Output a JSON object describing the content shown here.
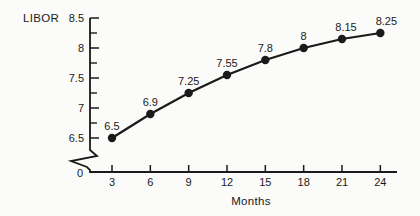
{
  "figure": {
    "background": "#fbfbf9",
    "ink": "#1a1a1a"
  },
  "chart_data": {
    "type": "line",
    "title": "",
    "xlabel": "Months",
    "ylabel": "LIBOR",
    "x": [
      3,
      6,
      9,
      12,
      15,
      18,
      21,
      24
    ],
    "values": [
      6.5,
      6.9,
      7.25,
      7.55,
      7.8,
      8.0,
      8.15,
      8.25
    ],
    "point_labels": [
      "6.5",
      "6.9",
      "7.25",
      "7.55",
      "7.8",
      "8",
      "8.15",
      "8.25"
    ],
    "x_tick_labels": [
      "3",
      "6",
      "9",
      "12",
      "15",
      "18",
      "21",
      "24"
    ],
    "y_ticks_major": [
      6.5,
      7,
      7.5,
      8,
      8.5
    ],
    "y_tick_labels": [
      "6.5",
      "7",
      "7.5",
      "8",
      "8.5"
    ],
    "y_ticks_minor": [
      6.75,
      7.25,
      7.75,
      8.25
    ],
    "y_origin_label": "0",
    "axis_break": true,
    "ylim": [
      6.5,
      8.5
    ],
    "xlim": [
      3,
      24
    ],
    "grid": false,
    "legend": false,
    "marker": "filled-circle",
    "line_color": "#1a1a1a"
  }
}
